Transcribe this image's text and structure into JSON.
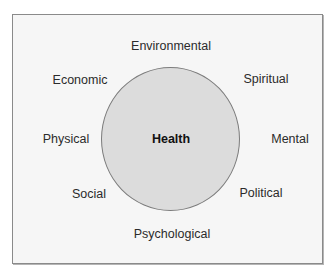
{
  "diagram": {
    "center": {
      "label": "Health"
    },
    "factors": [
      {
        "label": "Environmental",
        "x": 171,
        "y": 46
      },
      {
        "label": "Spiritual",
        "x": 266,
        "y": 79
      },
      {
        "label": "Mental",
        "x": 290,
        "y": 139
      },
      {
        "label": "Political",
        "x": 261,
        "y": 193
      },
      {
        "label": "Psychological",
        "x": 172,
        "y": 234
      },
      {
        "label": "Social",
        "x": 89,
        "y": 194
      },
      {
        "label": "Physical",
        "x": 66,
        "y": 139
      },
      {
        "label": "Economic",
        "x": 80,
        "y": 80
      }
    ],
    "colors": {
      "circle_fill": "#dcdcdc",
      "circle_stroke": "#7c7c7c",
      "frame_border": "#8a8a8a",
      "frame_bg": "#f6f6f6"
    }
  }
}
